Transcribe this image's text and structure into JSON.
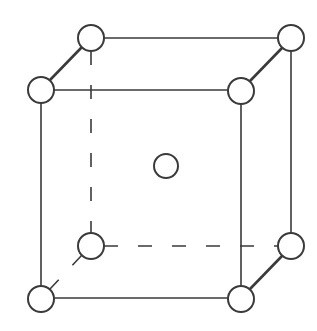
{
  "diagram": {
    "title": "Body-centered cubic unit cell",
    "type": "crystal-lattice",
    "colors": {
      "background": "#ffffff",
      "line": "#3a3a3a",
      "atom_fill": "#ffffff",
      "atom_stroke": "#3a3a3a"
    },
    "stroke": {
      "edge_width": 1.6,
      "depth_edge_width": 2.6,
      "atom_width": 2,
      "dash_pattern": "14 20"
    },
    "atoms": [
      {
        "id": "front-top-left",
        "cx": 41,
        "cy": 90,
        "r": 13
      },
      {
        "id": "front-top-right",
        "cx": 241,
        "cy": 91,
        "r": 13
      },
      {
        "id": "front-bottom-left",
        "cx": 41,
        "cy": 299,
        "r": 13
      },
      {
        "id": "front-bottom-right",
        "cx": 241,
        "cy": 299,
        "r": 13
      },
      {
        "id": "back-top-left",
        "cx": 91,
        "cy": 38,
        "r": 13
      },
      {
        "id": "back-top-right",
        "cx": 291,
        "cy": 38,
        "r": 13
      },
      {
        "id": "back-bottom-left",
        "cx": 91,
        "cy": 246,
        "r": 13
      },
      {
        "id": "back-bottom-right",
        "cx": 291,
        "cy": 246,
        "r": 13
      },
      {
        "id": "body-center",
        "cx": 166,
        "cy": 166,
        "r": 12
      }
    ],
    "edges": {
      "solid": [
        {
          "id": "front-top",
          "x1": 54,
          "y1": 90,
          "x2": 228,
          "y2": 90
        },
        {
          "id": "front-bottom",
          "x1": 54,
          "y1": 298,
          "x2": 228,
          "y2": 298
        },
        {
          "id": "front-left",
          "x1": 41,
          "y1": 103,
          "x2": 41,
          "y2": 286
        },
        {
          "id": "front-right",
          "x1": 241,
          "y1": 104,
          "x2": 241,
          "y2": 286
        },
        {
          "id": "back-top",
          "x1": 104,
          "y1": 38,
          "x2": 278,
          "y2": 38
        },
        {
          "id": "back-right",
          "x1": 291,
          "y1": 51,
          "x2": 291,
          "y2": 233
        }
      ],
      "depth": [
        {
          "id": "top-left-depth",
          "x1": 50,
          "y1": 80,
          "x2": 82,
          "y2": 47
        },
        {
          "id": "top-right-depth",
          "x1": 250,
          "y1": 81,
          "x2": 282,
          "y2": 48
        },
        {
          "id": "bottom-right-depth",
          "x1": 250,
          "y1": 289,
          "x2": 282,
          "y2": 256
        }
      ],
      "hidden": [
        {
          "id": "back-left-hidden",
          "x1": 91,
          "y1": 51,
          "x2": 91,
          "y2": 233
        },
        {
          "id": "back-bottom-hidden",
          "x1": 104,
          "y1": 246,
          "x2": 278,
          "y2": 246
        },
        {
          "id": "bottom-left-depth-hidden",
          "x1": 82,
          "y1": 255,
          "x2": 50,
          "y2": 289
        }
      ]
    }
  }
}
